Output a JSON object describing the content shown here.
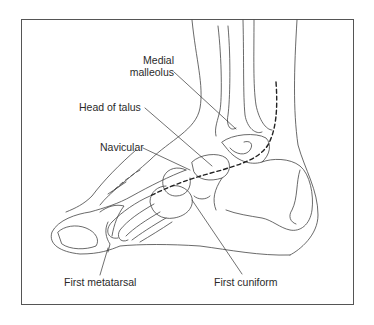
{
  "figure": {
    "labels": {
      "medial_malleolus_line1": "Medial",
      "medial_malleolus_line2": "malleolus",
      "head_of_talus": "Head of talus",
      "navicular": "Navicular",
      "first_metatarsal": "First metatarsal",
      "first_cuniform": "First cuniform"
    },
    "colors": {
      "line": "#444444",
      "frame": "#555555",
      "text": "#2a2a2a",
      "background": "#ffffff"
    },
    "annotations": {
      "dashed_line": "Incision path along medial foot from ankle to first cuniform"
    }
  }
}
